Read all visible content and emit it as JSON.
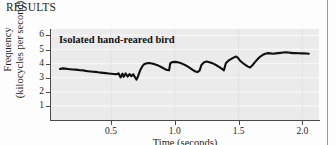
{
  "page": {
    "section_heading": "RESULTS"
  },
  "figure": {
    "annotation": "Isolated hand-reared bird"
  },
  "chart_data": {
    "type": "line",
    "title": "",
    "annotation": "Isolated hand-reared bird",
    "xlabel": "Time (seconds)",
    "ylabel_line1": "Frequency",
    "ylabel_line2": "(kilocycles per second)",
    "xlim": [
      0.03,
      2.13
    ],
    "ylim": [
      0,
      6.45
    ],
    "xticks": [
      0.5,
      1.0,
      1.5,
      2.0
    ],
    "xtick_labels": [
      "0.5",
      "1.0",
      "1.5",
      "2.0"
    ],
    "yticks": [
      1,
      2,
      3,
      4,
      5,
      6
    ],
    "ytick_labels": [
      "1",
      "2",
      "3",
      "4",
      "5",
      "6"
    ],
    "grid": "horizontal",
    "legend": "none",
    "plot_background": "#ebebeb",
    "trace_color": "#101010",
    "series": [
      {
        "name": "song spectrogram trace",
        "x": [
          0.1,
          0.12,
          0.14,
          0.16,
          0.18,
          0.2,
          0.22,
          0.24,
          0.26,
          0.28,
          0.3,
          0.32,
          0.34,
          0.36,
          0.38,
          0.4,
          0.42,
          0.44,
          0.46,
          0.48,
          0.5,
          0.52,
          0.54,
          0.56,
          0.575,
          0.59,
          0.6,
          0.615,
          0.63,
          0.645,
          0.66,
          0.675,
          0.69,
          0.7,
          0.71,
          0.72,
          0.73,
          0.745,
          0.76,
          0.78,
          0.8,
          0.82,
          0.84,
          0.86,
          0.88,
          0.9,
          0.92,
          0.94,
          0.955,
          0.965,
          0.98,
          1.0,
          1.02,
          1.04,
          1.06,
          1.08,
          1.1,
          1.12,
          1.14,
          1.16,
          1.18,
          1.195,
          1.21,
          1.23,
          1.25,
          1.27,
          1.29,
          1.31,
          1.33,
          1.35,
          1.37,
          1.385,
          1.4,
          1.42,
          1.44,
          1.46,
          1.48,
          1.495,
          1.51,
          1.53,
          1.55,
          1.57,
          1.59,
          1.61,
          1.63,
          1.65,
          1.67,
          1.69,
          1.71,
          1.73,
          1.75,
          1.77,
          1.79,
          1.81,
          1.83,
          1.85,
          1.87,
          1.89,
          1.91,
          1.93,
          1.95,
          1.97,
          1.99,
          2.01,
          2.03,
          2.05
        ],
        "y": [
          3.62,
          3.66,
          3.64,
          3.62,
          3.6,
          3.58,
          3.57,
          3.55,
          3.53,
          3.52,
          3.48,
          3.46,
          3.44,
          3.42,
          3.41,
          3.38,
          3.36,
          3.34,
          3.32,
          3.3,
          3.28,
          3.26,
          3.24,
          3.3,
          3.02,
          3.28,
          3.06,
          3.3,
          3.08,
          3.26,
          3.1,
          3.24,
          3.0,
          2.86,
          3.05,
          3.3,
          3.55,
          3.8,
          3.95,
          4.02,
          4.04,
          4.0,
          3.96,
          3.9,
          3.82,
          3.72,
          3.62,
          3.55,
          3.52,
          4.02,
          4.1,
          4.12,
          4.1,
          4.05,
          3.98,
          3.9,
          3.8,
          3.68,
          3.56,
          3.44,
          3.4,
          3.52,
          3.92,
          4.1,
          4.14,
          4.1,
          4.04,
          3.96,
          3.86,
          3.74,
          3.62,
          3.52,
          4.02,
          4.2,
          4.32,
          4.42,
          4.5,
          4.4,
          4.22,
          4.06,
          3.92,
          3.8,
          3.72,
          3.9,
          4.12,
          4.32,
          4.5,
          4.62,
          4.7,
          4.74,
          4.72,
          4.7,
          4.72,
          4.74,
          4.76,
          4.78,
          4.8,
          4.78,
          4.76,
          4.74,
          4.74,
          4.73,
          4.72,
          4.72,
          4.71,
          4.7
        ],
        "y_unit": "kilocycles per second"
      }
    ]
  }
}
